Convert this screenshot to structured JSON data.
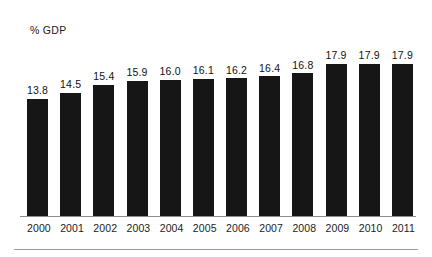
{
  "figure": {
    "axis_label": "% GDP"
  },
  "chart_data": {
    "type": "bar",
    "title": "",
    "subtitle": "",
    "xlabel": "",
    "ylabel": "% GDP",
    "categories": [
      "2000",
      "2001",
      "2002",
      "2003",
      "2004",
      "2005",
      "2006",
      "2007",
      "2008",
      "2009",
      "2010",
      "2011"
    ],
    "values": [
      13.8,
      14.5,
      15.4,
      15.9,
      16.0,
      16.1,
      16.2,
      16.4,
      16.8,
      17.9,
      17.9,
      17.9
    ],
    "value_labels": [
      "13.8",
      "14.5",
      "15.4",
      "15.9",
      "16.0",
      "16.1",
      "16.2",
      "16.4",
      "16.8",
      "17.9",
      "17.9",
      "17.9"
    ],
    "ylim": [
      0,
      19.5
    ],
    "grid": false,
    "legend": null,
    "bar_color": "#161616",
    "baseline_color": "#8e8e8e",
    "background_color": "#ffffff",
    "data_labels_shown": true
  }
}
